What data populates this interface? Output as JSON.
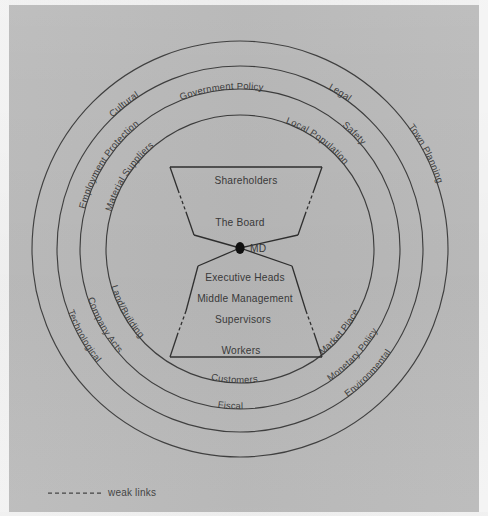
{
  "figure": {
    "background_color": "#b9b9b9",
    "ink_color": "#3a3a3a",
    "center": {
      "x": 240,
      "y": 249
    }
  },
  "legend": {
    "dash_symbol": "------",
    "label": "weak links"
  },
  "organisation": {
    "upper": {
      "levels": [
        {
          "id": "shareholders",
          "label": "Shareholders",
          "x": 246,
          "y": 184
        },
        {
          "id": "the-board",
          "label": "The Board",
          "x": 240,
          "y": 226
        }
      ]
    },
    "pivot": {
      "id": "md",
      "label": "MD",
      "x": 240,
      "y": 248,
      "dot_r": 5.2
    },
    "lower": {
      "levels": [
        {
          "id": "executive-heads",
          "label": "Executive Heads",
          "x": 245,
          "y": 280
        },
        {
          "id": "middle-management",
          "label": "Middle Management",
          "x": 245,
          "y": 301
        },
        {
          "id": "supervisors",
          "label": "Supervisors",
          "x": 243,
          "y": 322
        },
        {
          "id": "workers",
          "label": "Workers",
          "x": 241,
          "y": 353
        }
      ]
    }
  },
  "rings": [
    {
      "id": "ring-1-inner",
      "radius": 134,
      "labels": [
        {
          "text": "Material Suppliers",
          "angle_deg": 222,
          "side": "upper"
        },
        {
          "text": "Local Population",
          "angle_deg": 318,
          "side": "upper"
        },
        {
          "text": "Land/Building",
          "angle_deg": 215,
          "side": "lower"
        },
        {
          "text": "Customers",
          "angle_deg": 270,
          "side": "lower"
        },
        {
          "text": "Market Place",
          "angle_deg": 325,
          "side": "lower"
        }
      ]
    },
    {
      "id": "ring-2",
      "radius": 160,
      "labels": [
        {
          "text": "Government Policy",
          "angle_deg": 268,
          "side": "upper"
        },
        {
          "text": "Employment Protection",
          "angle_deg": 212,
          "side": "upper"
        },
        {
          "text": "Safety",
          "angle_deg": 324,
          "side": "upper"
        },
        {
          "text": "Company Acts",
          "angle_deg": 214,
          "side": "lower"
        },
        {
          "text": "Fiscal",
          "angle_deg": 270,
          "side": "lower"
        },
        {
          "text": "Monetary Policy",
          "angle_deg": 326,
          "side": "lower"
        }
      ]
    },
    {
      "id": "ring-3",
      "radius": 183,
      "labels": [
        {
          "text": "Cultural",
          "angle_deg": 248,
          "side": "upper"
        },
        {
          "text": "Legal",
          "angle_deg": 298,
          "side": "upper"
        },
        {
          "text": "Technological",
          "angle_deg": 216,
          "side": "lower"
        },
        {
          "text": "Environmental",
          "angle_deg": 324,
          "side": "lower"
        }
      ]
    },
    {
      "id": "ring-4-outer",
      "radius": 208,
      "labels": [
        {
          "text": "Town Planning",
          "angle_deg": 340,
          "side": "upper"
        }
      ]
    }
  ],
  "ring_labels_flat": [
    "Cultural",
    "Government Policy",
    "Legal",
    "Safety",
    "Employment Protection",
    "Material Suppliers",
    "Local Population",
    "Town Planning",
    "Land/Building",
    "Company Acts",
    "Technological",
    "Customers",
    "Fiscal",
    "Market Place",
    "Monetary Policy",
    "Environmental"
  ]
}
